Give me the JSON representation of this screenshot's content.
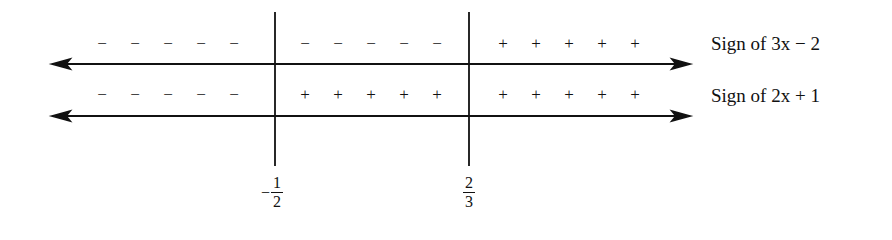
{
  "diagram": {
    "rows": [
      {
        "label": "Sign of 3x − 2",
        "signs": [
          "−",
          "−",
          "−",
          "−",
          "−",
          "−",
          "−",
          "−",
          "−",
          "−",
          "+",
          "+",
          "+",
          "+",
          "+"
        ]
      },
      {
        "label": "Sign of 2x + 1",
        "signs": [
          "−",
          "−",
          "−",
          "−",
          "−",
          "+",
          "+",
          "+",
          "+",
          "+",
          "+",
          "+",
          "+",
          "+",
          "+"
        ]
      }
    ],
    "critical_points": [
      {
        "sign": "−",
        "numerator": "1",
        "denominator": "2"
      },
      {
        "sign": "",
        "numerator": "2",
        "denominator": "3"
      }
    ]
  }
}
